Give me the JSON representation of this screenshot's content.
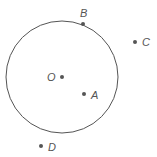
{
  "diagram": {
    "circle": {
      "cx": 62,
      "cy": 77,
      "r": 56,
      "stroke": "#555555"
    },
    "points": [
      {
        "id": "B",
        "label": "B",
        "x": 83,
        "y": 24,
        "lx": 80,
        "ly": 17
      },
      {
        "id": "C",
        "label": "C",
        "x": 135,
        "y": 42,
        "lx": 142,
        "ly": 46
      },
      {
        "id": "O",
        "label": "O",
        "x": 62,
        "y": 77,
        "lx": 47,
        "ly": 81
      },
      {
        "id": "A",
        "label": "A",
        "x": 84,
        "y": 94,
        "lx": 91,
        "ly": 99
      },
      {
        "id": "D",
        "label": "D",
        "x": 41,
        "y": 146,
        "lx": 48,
        "ly": 151
      }
    ],
    "point_color": "#555555"
  }
}
